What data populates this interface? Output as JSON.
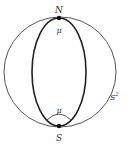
{
  "diagram": {
    "sphere_label": "S",
    "sphere_label_sup": "2",
    "north_label": "N",
    "south_label": "S",
    "north_angle_label": "μ",
    "south_angle_label": "μ",
    "colors": {
      "outer_circle": "#555555",
      "inner_curve": "#222222",
      "points": "#111111",
      "labels": "#333333"
    }
  }
}
